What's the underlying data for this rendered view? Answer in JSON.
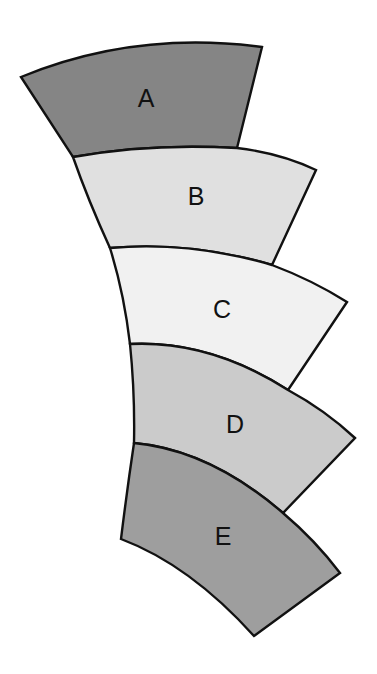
{
  "diagram": {
    "title": "",
    "segments": [
      {
        "label": "A",
        "fill": "#858585"
      },
      {
        "label": "B",
        "fill": "#e0e0e0"
      },
      {
        "label": "C",
        "fill": "#f1f1f1"
      },
      {
        "label": "D",
        "fill": "#cbcbcb"
      },
      {
        "label": "E",
        "fill": "#9e9e9e"
      }
    ],
    "stroke_color": "#111111",
    "background": "#ffffff"
  }
}
